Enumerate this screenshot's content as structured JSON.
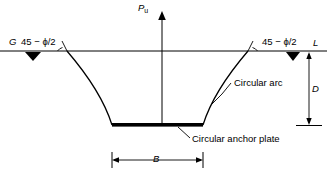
{
  "figure": {
    "type": "geotechnical-cross-section",
    "labels": {
      "load_arrow": "P",
      "load_arrow_subscript": "u",
      "ground_left": "G",
      "angle_left": "45 − ϕ/2",
      "angle_right": "45 − ϕ/2",
      "ground_surface": "L",
      "depth": "D",
      "width": "B",
      "arc_callout": "Circular arc",
      "plate_callout": "Circular anchor plate"
    },
    "colors": {
      "line": "#000000",
      "background": "#ffffff",
      "text": "#000000"
    }
  }
}
